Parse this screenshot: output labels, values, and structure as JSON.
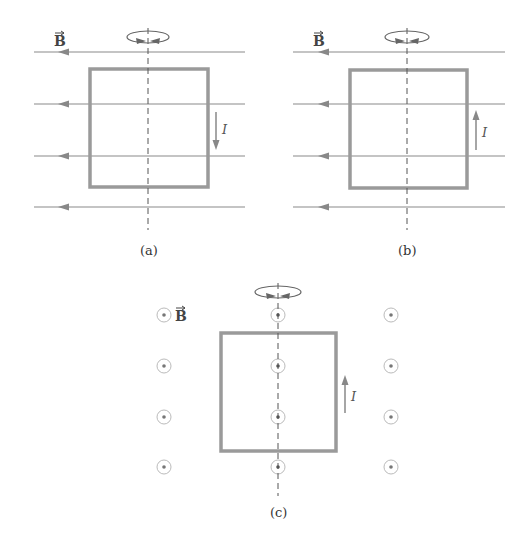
{
  "figure": {
    "panels": [
      {
        "id": "a",
        "caption": "(a)",
        "field_label": "B",
        "field_direction": "left (in plane)",
        "current_label": "I",
        "current_direction": "down"
      },
      {
        "id": "b",
        "caption": "(b)",
        "field_label": "B",
        "field_direction": "left (in plane)",
        "current_label": "I",
        "current_direction": "up"
      },
      {
        "id": "c",
        "caption": "(c)",
        "field_label": "B",
        "field_direction": "out of page",
        "current_label": "I",
        "current_direction": "up"
      }
    ],
    "colors": {
      "line": "#8a8a8a",
      "loop": "#9a9a9a",
      "axis": "#555555",
      "text": "#333333"
    }
  }
}
